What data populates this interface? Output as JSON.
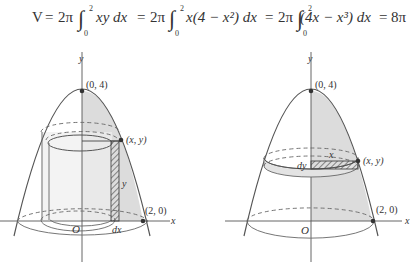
{
  "equation": {
    "V": "V",
    "eq1": "=",
    "t1_coef": "2π",
    "t1_upper": "2",
    "t1_lower": "0",
    "t1_integrand": "xy dx",
    "eq2": "=",
    "t2_coef": "2π",
    "t2_upper": "2",
    "t2_lower": "0",
    "t2_integrand": "x(4 − x²) dx",
    "eq3": "=",
    "t3_coef": "2π",
    "t3_upper": "2",
    "t3_lower": "0",
    "t3_integrand": "(4x − x³) dx",
    "eq4": "=",
    "result": "8π"
  },
  "figure_left": {
    "y_axis": "y",
    "x_axis": "x",
    "vertex_label": "(0, 4)",
    "point_label": "(x, y)",
    "root_label": "(2, 0)",
    "origin": "O",
    "height_label": "y",
    "width_label": "dx"
  },
  "figure_right": {
    "y_axis": "y",
    "x_axis": "x",
    "vertex_label": "(0, 4)",
    "point_label": "(x, y)",
    "root_label": "(2, 0)",
    "origin": "O",
    "radius_label": "x",
    "thickness_label": "dy"
  },
  "colors": {
    "shade": "#d9d9d9",
    "line": "#444444",
    "point": "#333333"
  }
}
